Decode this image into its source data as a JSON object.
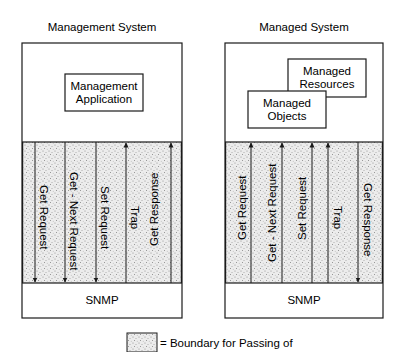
{
  "management_system": {
    "title": "Management System",
    "application_box": {
      "line1": "Management",
      "line2": "Application"
    },
    "messages": [
      {
        "label": "Get Request",
        "direction": "down"
      },
      {
        "label": "Get - Next Request",
        "direction": "down"
      },
      {
        "label": "Set Request",
        "direction": "down"
      },
      {
        "label": "Trap",
        "direction": "up"
      },
      {
        "label": "Get Response",
        "direction": "up"
      }
    ],
    "protocol_label": "SNMP"
  },
  "managed_system": {
    "title": "Managed System",
    "resources_box": {
      "line1": "Managed",
      "line2": "Resources"
    },
    "objects_box": {
      "line1": "Managed",
      "line2": "Objects"
    },
    "messages": [
      {
        "label": "Get Request",
        "direction": "up"
      },
      {
        "label": "Get - Next Request",
        "direction": "up"
      },
      {
        "label": "Set Request",
        "direction": "up"
      },
      {
        "label": "Trap",
        "direction": "down"
      },
      {
        "label": "Get Response",
        "direction": "down"
      }
    ],
    "protocol_label": "SNMP"
  },
  "legend": {
    "text": "= Boundary for Passing of"
  },
  "colors": {
    "line": "#1a1a1a",
    "stipple_bg": "#e9e9e9",
    "stipple_dot": "#8a8a8a"
  }
}
